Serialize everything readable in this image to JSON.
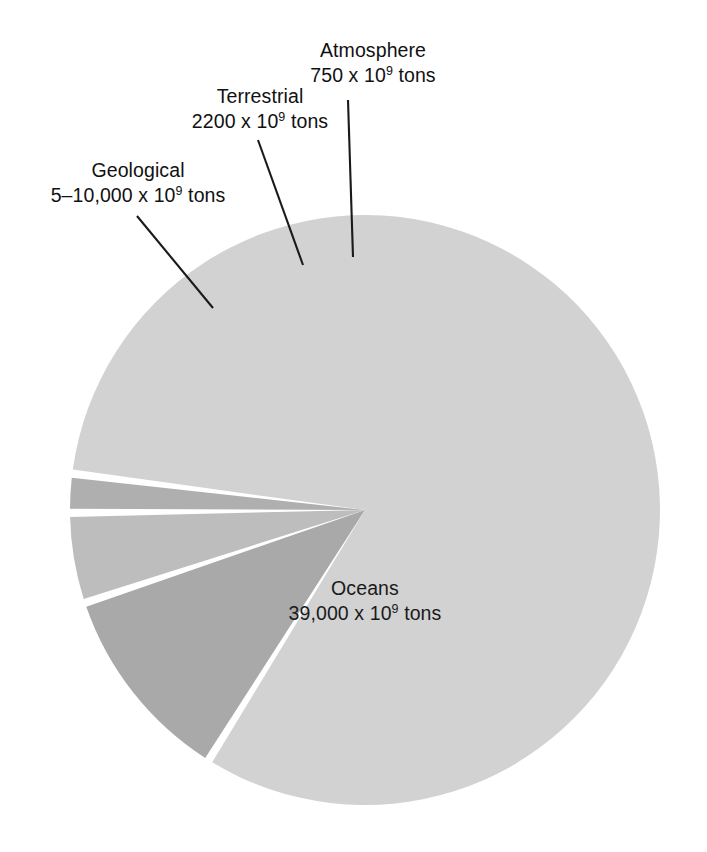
{
  "figure": {
    "background_color": "#ffffff",
    "text_color": "#111111",
    "leader_line_color": "#1a1a1a"
  },
  "chart_data": {
    "type": "pie",
    "title": "",
    "subtitle": "",
    "xlabel": "",
    "ylabel": "",
    "grid": false,
    "legend_position": "callout-labels",
    "units": "10^9 tons",
    "center": {
      "x": 365,
      "y": 510
    },
    "radius": 295,
    "start_angle_deg_from_top": -148,
    "slice_gap_deg": 1.6,
    "categories": [
      "Geological",
      "Terrestrial",
      "Atmosphere",
      "Oceans"
    ],
    "values": [
      7500,
      2200,
      750,
      39000
    ],
    "value_labels": [
      "5–10,000 x 10⁹ tons",
      "2200 x 10⁹ tons",
      "750 x 10⁹ tons",
      "39,000 x 10⁹ tons"
    ],
    "colors": [
      "#a9a9a9",
      "#bdbdbd",
      "#afafaf",
      "#d2d2d2"
    ],
    "slices": [
      {
        "name": "Geological",
        "value": 7500,
        "value_range": [
          5000,
          10000
        ],
        "sweep_deg": 39.0,
        "color": "#a9a9a9"
      },
      {
        "name": "Terrestrial",
        "value": 2200,
        "sweep_deg": 17.5,
        "color": "#bdbdbd"
      },
      {
        "name": "Atmosphere",
        "value": 750,
        "sweep_deg": 7.5,
        "color": "#afafaf"
      },
      {
        "name": "Oceans",
        "value": 39000,
        "sweep_deg": 290.0,
        "color": "#d2d2d2"
      }
    ]
  },
  "labels": {
    "geological": {
      "category": "Geological",
      "value_prefix": "5–10,000 x 10",
      "exponent": "9",
      "value_suffix": " tons"
    },
    "terrestrial": {
      "category": "Terrestrial",
      "value_prefix": "2200 x 10",
      "exponent": "9",
      "value_suffix": " tons"
    },
    "atmosphere": {
      "category": "Atmosphere",
      "value_prefix": "750 x 10",
      "exponent": "9",
      "value_suffix": " tons"
    },
    "oceans": {
      "category": "Oceans",
      "value_prefix": "39,000 x 10",
      "exponent": "9",
      "value_suffix": " tons"
    }
  }
}
